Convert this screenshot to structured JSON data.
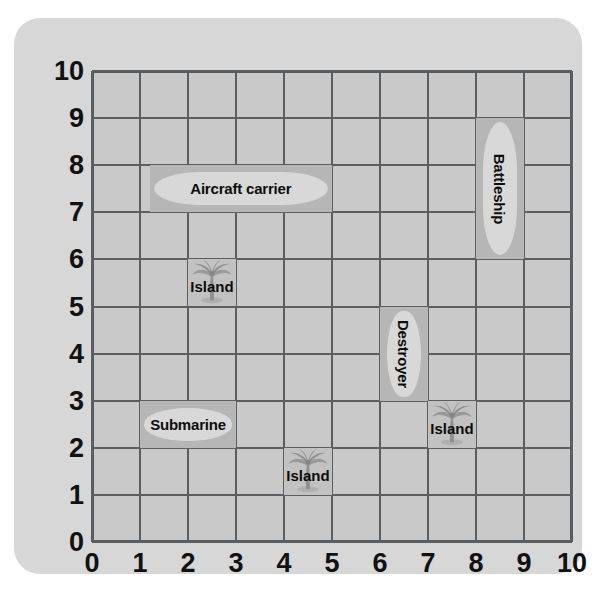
{
  "board": {
    "title": "Battleship coordinate grid",
    "x_axis": {
      "label": "",
      "ticks": [
        "0",
        "1",
        "2",
        "3",
        "4",
        "5",
        "6",
        "7",
        "8",
        "9",
        "10"
      ],
      "min": 0,
      "max": 10
    },
    "y_axis": {
      "label": "",
      "ticks": [
        "10",
        "9",
        "8",
        "7",
        "6",
        "5",
        "4",
        "3",
        "2",
        "1",
        "0"
      ],
      "min": 0,
      "max": 10
    },
    "colors": {
      "card": "#d7d7d7",
      "grid_fill": "#c9c9c9",
      "grid_line": "#5a5f63",
      "ship_cell": "#b6b6b6",
      "ship_hull": "#d8d8d8",
      "island_cell": "#c2c2c2",
      "text": "#111111"
    }
  },
  "chart_data": {
    "type": "scatter",
    "xlabel": "",
    "ylabel": "",
    "xlim": [
      0,
      10
    ],
    "ylim": [
      0,
      10
    ],
    "grid": true,
    "legend": "none",
    "items": [
      {
        "name": "Aircraft carrier",
        "kind": "ship",
        "orientation": "horizontal",
        "x_start": 1.2,
        "x_end": 5.0,
        "y_start": 7,
        "y_end": 8
      },
      {
        "name": "Battleship",
        "kind": "ship",
        "orientation": "vertical",
        "x_start": 8,
        "x_end": 9,
        "y_start": 6.0,
        "y_end": 9.0
      },
      {
        "name": "Destroyer",
        "kind": "ship",
        "orientation": "vertical",
        "x_start": 6,
        "x_end": 7,
        "y_start": 3.0,
        "y_end": 5.0
      },
      {
        "name": "Submarine",
        "kind": "ship",
        "orientation": "horizontal",
        "x_start": 1.0,
        "x_end": 3.0,
        "y_start": 2,
        "y_end": 3
      },
      {
        "name": "Island",
        "kind": "island",
        "x_start": 2,
        "x_end": 3,
        "y_start": 5,
        "y_end": 6
      },
      {
        "name": "Island",
        "kind": "island",
        "x_start": 7,
        "x_end": 8,
        "y_start": 2,
        "y_end": 3
      },
      {
        "name": "Island",
        "kind": "island",
        "x_start": 4,
        "x_end": 5,
        "y_start": 1,
        "y_end": 2
      }
    ]
  }
}
